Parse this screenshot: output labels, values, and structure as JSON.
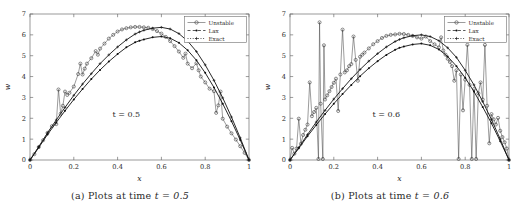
{
  "figure": {
    "panels": [
      {
        "id": "panel-a",
        "caption_prefix": "(a)",
        "caption_text": "Plots at time",
        "caption_math": "t = 0.5",
        "annotation": "t = 0.5"
      },
      {
        "id": "panel-b",
        "caption_prefix": "(b)",
        "caption_text": "Plots at time",
        "caption_math": "t = 0.6",
        "annotation": "t = 0.6"
      }
    ],
    "legend": {
      "entries": [
        {
          "label": "Unstable",
          "marker": "circle",
          "line": "solid"
        },
        {
          "label": "Lax",
          "marker": "dot",
          "line": "dashed"
        },
        {
          "label": "Exact",
          "marker": "plus",
          "line": "dotted"
        }
      ]
    }
  },
  "chart_data": [
    {
      "type": "line",
      "title": "",
      "panel": "(a) Plots at time t = 0.5",
      "annotation": "t = 0.5",
      "xlabel": "x",
      "ylabel": "w",
      "xlim": [
        0,
        1
      ],
      "ylim": [
        0,
        7
      ],
      "xticks": [
        0,
        0.2,
        0.4,
        0.6,
        0.8,
        1
      ],
      "xticklabels": [
        "0",
        "0.2",
        "0.4",
        "0.6",
        "0.8",
        "1"
      ],
      "yticks": [
        0,
        1,
        2,
        3,
        4,
        5,
        6,
        7
      ],
      "yticklabels": [
        "0",
        "1",
        "2",
        "3",
        "4",
        "5",
        "6",
        "7"
      ],
      "grid": false,
      "legend_position": "top-right",
      "series": [
        {
          "name": "Unstable",
          "marker": "circle",
          "x": [
            0.0,
            0.02,
            0.04,
            0.06,
            0.08,
            0.1,
            0.12,
            0.13,
            0.14,
            0.15,
            0.16,
            0.17,
            0.18,
            0.2,
            0.22,
            0.23,
            0.24,
            0.25,
            0.26,
            0.28,
            0.3,
            0.31,
            0.32,
            0.34,
            0.36,
            0.38,
            0.4,
            0.42,
            0.44,
            0.46,
            0.48,
            0.5,
            0.52,
            0.54,
            0.56,
            0.58,
            0.6,
            0.62,
            0.64,
            0.66,
            0.68,
            0.7,
            0.71,
            0.72,
            0.74,
            0.76,
            0.77,
            0.78,
            0.8,
            0.82,
            0.84,
            0.85,
            0.86,
            0.87,
            0.88,
            0.9,
            0.92,
            0.94,
            0.96,
            0.98,
            1.0
          ],
          "y": [
            0.0,
            0.28,
            0.62,
            0.95,
            1.3,
            1.62,
            1.72,
            3.38,
            2.22,
            2.6,
            3.28,
            3.12,
            3.22,
            3.52,
            4.12,
            4.62,
            4.1,
            4.38,
            4.62,
            4.88,
            5.22,
            5.05,
            5.34,
            5.58,
            5.82,
            6.0,
            6.16,
            6.26,
            6.32,
            6.36,
            6.38,
            6.38,
            6.36,
            6.34,
            6.28,
            6.18,
            6.06,
            5.9,
            5.7,
            5.46,
            5.2,
            4.9,
            5.1,
            4.62,
            4.4,
            4.64,
            4.3,
            4.0,
            3.72,
            3.42,
            3.3,
            2.26,
            2.62,
            3.28,
            1.98,
            1.6,
            1.28,
            0.98,
            0.66,
            0.34,
            0.0
          ]
        },
        {
          "name": "Lax",
          "marker": "dot",
          "x": [
            0.0,
            0.04,
            0.08,
            0.12,
            0.16,
            0.2,
            0.24,
            0.28,
            0.32,
            0.36,
            0.4,
            0.44,
            0.48,
            0.5,
            0.52,
            0.56,
            0.6,
            0.64,
            0.68,
            0.72,
            0.76,
            0.8,
            0.84,
            0.88,
            0.92,
            0.96,
            1.0
          ],
          "y": [
            0.0,
            0.6,
            1.22,
            1.8,
            2.36,
            2.9,
            3.4,
            3.88,
            4.32,
            4.72,
            5.08,
            5.4,
            5.64,
            5.72,
            5.78,
            5.88,
            5.92,
            5.84,
            5.62,
            5.26,
            4.78,
            4.18,
            3.48,
            2.7,
            1.86,
            0.96,
            0.0
          ]
        },
        {
          "name": "Exact",
          "marker": "plus",
          "x": [
            0.0,
            0.04,
            0.08,
            0.12,
            0.16,
            0.2,
            0.24,
            0.28,
            0.32,
            0.36,
            0.4,
            0.44,
            0.48,
            0.5,
            0.52,
            0.56,
            0.6,
            0.64,
            0.68,
            0.72,
            0.76,
            0.8,
            0.84,
            0.88,
            0.92,
            0.96,
            1.0
          ],
          "y": [
            0.0,
            0.64,
            1.3,
            1.92,
            2.52,
            3.1,
            3.64,
            4.14,
            4.62,
            5.04,
            5.42,
            5.76,
            6.04,
            6.14,
            6.22,
            6.32,
            6.36,
            6.28,
            6.06,
            5.7,
            5.2,
            4.56,
            3.82,
            2.98,
            2.06,
            1.06,
            0.0
          ]
        }
      ]
    },
    {
      "type": "line",
      "title": "",
      "panel": "(b) Plots at time t = 0.6",
      "annotation": "t = 0.6",
      "xlabel": "x",
      "ylabel": "w",
      "xlim": [
        0,
        1
      ],
      "ylim": [
        0,
        7
      ],
      "xticks": [
        0,
        0.2,
        0.4,
        0.6,
        0.8,
        1
      ],
      "xticklabels": [
        "0",
        "0.2",
        "0.4",
        "0.6",
        "0.8",
        "1"
      ],
      "yticks": [
        0,
        1,
        2,
        3,
        4,
        5,
        6,
        7
      ],
      "yticklabels": [
        "0",
        "1",
        "2",
        "3",
        "4",
        "5",
        "6",
        "7"
      ],
      "grid": false,
      "legend_position": "top-right",
      "series": [
        {
          "name": "Unstable",
          "marker": "circle",
          "x": [
            0.0,
            0.01,
            0.02,
            0.03,
            0.04,
            0.05,
            0.06,
            0.07,
            0.08,
            0.09,
            0.1,
            0.11,
            0.12,
            0.13,
            0.135,
            0.14,
            0.15,
            0.155,
            0.16,
            0.17,
            0.18,
            0.19,
            0.2,
            0.21,
            0.22,
            0.23,
            0.24,
            0.25,
            0.26,
            0.27,
            0.28,
            0.29,
            0.3,
            0.31,
            0.32,
            0.33,
            0.34,
            0.36,
            0.38,
            0.4,
            0.42,
            0.44,
            0.46,
            0.48,
            0.5,
            0.52,
            0.54,
            0.56,
            0.58,
            0.6,
            0.62,
            0.64,
            0.66,
            0.68,
            0.69,
            0.7,
            0.71,
            0.72,
            0.73,
            0.74,
            0.75,
            0.76,
            0.77,
            0.78,
            0.79,
            0.8,
            0.81,
            0.82,
            0.83,
            0.84,
            0.85,
            0.86,
            0.87,
            0.88,
            0.89,
            0.9,
            0.91,
            0.92,
            0.93,
            0.94,
            0.95,
            0.96,
            0.97,
            0.98,
            0.99,
            1.0
          ],
          "y": [
            0.0,
            0.58,
            0.3,
            0.55,
            1.98,
            0.78,
            1.2,
            1.45,
            1.7,
            3.72,
            2.1,
            2.3,
            2.5,
            0.05,
            6.6,
            2.7,
            0.05,
            5.5,
            2.9,
            3.1,
            3.3,
            3.5,
            3.7,
            3.9,
            2.35,
            4.1,
            6.25,
            4.2,
            4.3,
            4.5,
            4.6,
            5.92,
            4.8,
            3.8,
            4.95,
            5.05,
            5.15,
            5.35,
            5.55,
            5.7,
            5.85,
            5.95,
            6.0,
            6.02,
            6.05,
            6.04,
            6.0,
            5.95,
            5.88,
            5.82,
            5.92,
            5.7,
            5.55,
            5.4,
            5.88,
            5.25,
            5.05,
            4.85,
            4.7,
            4.5,
            3.8,
            4.3,
            0.05,
            4.1,
            2.38,
            3.85,
            5.52,
            3.6,
            0.05,
            3.4,
            0.05,
            3.2,
            3.72,
            2.9,
            5.52,
            2.6,
            0.8,
            2.2,
            1.95,
            1.7,
            2.02,
            1.4,
            1.1,
            0.85,
            0.55,
            0.0
          ]
        },
        {
          "name": "Lax",
          "marker": "dot",
          "x": [
            0.0,
            0.04,
            0.08,
            0.12,
            0.16,
            0.2,
            0.24,
            0.28,
            0.32,
            0.36,
            0.4,
            0.44,
            0.48,
            0.5,
            0.52,
            0.56,
            0.6,
            0.64,
            0.68,
            0.72,
            0.76,
            0.8,
            0.84,
            0.88,
            0.92,
            0.96,
            1.0
          ],
          "y": [
            0.0,
            0.56,
            1.14,
            1.68,
            2.2,
            2.7,
            3.16,
            3.6,
            4.02,
            4.4,
            4.74,
            5.04,
            5.28,
            5.38,
            5.44,
            5.54,
            5.58,
            5.5,
            5.3,
            4.96,
            4.5,
            3.94,
            3.28,
            2.54,
            1.76,
            0.9,
            0.0
          ]
        },
        {
          "name": "Exact",
          "marker": "plus",
          "x": [
            0.0,
            0.04,
            0.08,
            0.12,
            0.16,
            0.2,
            0.24,
            0.28,
            0.32,
            0.36,
            0.4,
            0.44,
            0.48,
            0.5,
            0.52,
            0.56,
            0.6,
            0.64,
            0.68,
            0.72,
            0.76,
            0.8,
            0.84,
            0.88,
            0.92,
            0.96,
            1.0
          ],
          "y": [
            0.0,
            0.6,
            1.22,
            1.82,
            2.38,
            2.92,
            3.42,
            3.9,
            4.34,
            4.74,
            5.1,
            5.42,
            5.68,
            5.78,
            5.86,
            5.96,
            6.0,
            5.92,
            5.72,
            5.38,
            4.92,
            4.3,
            3.6,
            2.8,
            1.94,
            1.0,
            0.0
          ]
        }
      ]
    }
  ]
}
